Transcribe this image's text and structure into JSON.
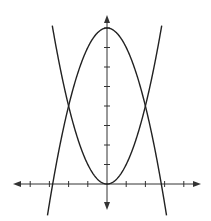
{
  "chart_data": {
    "type": "line",
    "title": "",
    "xlabel": "",
    "ylabel": "",
    "grid": false,
    "legend": "none",
    "xlim": [
      -5,
      5
    ],
    "ylim": [
      -1.5,
      8.5
    ],
    "x_ticks": [
      -4,
      -3,
      -2,
      -1,
      1,
      2,
      3,
      4
    ],
    "y_ticks": [
      1,
      2,
      3,
      4,
      5,
      6,
      7,
      8
    ],
    "series": [
      {
        "name": "y = x^2",
        "equation": "y = x^2",
        "vertex": [
          0,
          0
        ],
        "opens": "up",
        "color": "#222222"
      },
      {
        "name": "y = 8 - x^2",
        "equation": "y = 8 - x^2",
        "vertex": [
          0,
          8
        ],
        "opens": "down",
        "color": "#222222"
      }
    ],
    "intersections": [
      [
        -2,
        4
      ],
      [
        2,
        4
      ]
    ],
    "annotations": []
  },
  "colors": {
    "axis": "#333333",
    "curve": "#222222",
    "background": "#ffffff"
  }
}
